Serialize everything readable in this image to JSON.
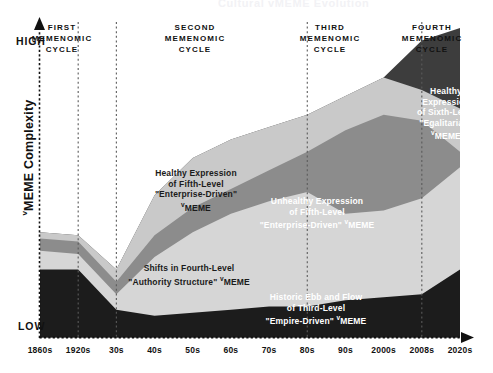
{
  "page": {
    "cut_off_title": "Cultural ᴠMEME Evolution",
    "background_color": "#ffffff"
  },
  "axes": {
    "y_title": "ᴠMEME Complexity",
    "y_title_prefix": "ᴠ",
    "y_title_rest": "MEME Complexity",
    "y_high_label": "HIGH",
    "y_low_label": "LOW",
    "x_tick_labels": [
      "1860s",
      "1920s",
      "30s",
      "40s",
      "50s",
      "60s",
      "70s",
      "80s",
      "90s",
      "2000s",
      "2008s",
      "2020s"
    ],
    "axis_color": "#111111",
    "axis_style": "dotted-arrow"
  },
  "cycles": [
    {
      "id": "first",
      "label_lines": [
        "FIRST",
        "MEMENOMIC",
        "CYCLE"
      ]
    },
    {
      "id": "second",
      "label_lines": [
        "SECOND",
        "MEMENOMIC",
        "CYCLE"
      ]
    },
    {
      "id": "third",
      "label_lines": [
        "THIRD",
        "MEMENOMIC",
        "CYCLE"
      ]
    },
    {
      "id": "fourth",
      "label_lines": [
        "FOURTH",
        "MEMENOMIC",
        "CYCLE"
      ]
    }
  ],
  "area_labels": [
    {
      "id": "healthy-fifth",
      "lines": [
        "Healthy Expression",
        "of Fifth-Level",
        "\"Enterprise-Driven\"",
        "ᴠMEME"
      ],
      "tone": "dark"
    },
    {
      "id": "unhealthy-fifth",
      "lines": [
        "Unhealthy Expression",
        "of Fifth-Level",
        "\"Enterprise-Driven\" ᴠMEME"
      ],
      "tone": "light"
    },
    {
      "id": "shifts-fourth",
      "lines": [
        "Shifts in Fourth-Level",
        "\"Authority Structure\" ᴠMEME"
      ],
      "tone": "dark"
    },
    {
      "id": "historic-third",
      "lines": [
        "Historic Ebb and Flow",
        "of Third-Level",
        "\"Empire-Driven\" ᴠMEME"
      ],
      "tone": "light"
    },
    {
      "id": "healthy-sixth",
      "lines": [
        "Healthy",
        "Expression",
        "of  Sixth-Level",
        "\"Egalitarian\"",
        "ᴠMEME"
      ],
      "tone": "light"
    }
  ],
  "chart_data": {
    "type": "area",
    "xlabel": "",
    "ylabel": "ᴠMEME Complexity",
    "ylim": [
      0,
      100
    ],
    "ylim_labels": [
      "LOW",
      "HIGH"
    ],
    "grid": false,
    "legend_position": "inline-annotations",
    "x": [
      "1860s",
      "1920s",
      "30s",
      "40s",
      "50s",
      "60s",
      "70s",
      "80s",
      "90s",
      "2000s",
      "2008s",
      "2020s"
    ],
    "cycle_boundaries": [
      "1920s",
      "30s",
      "80s",
      "2008s"
    ],
    "series": [
      {
        "name": "Historic Ebb and Flow of Third-Level \"Empire-Driven\" ᴠMEME",
        "color": "#1c1c1c",
        "stacked_top_values": [
          22,
          22,
          9,
          7,
          8,
          9,
          10,
          10,
          12,
          13,
          14,
          22
        ]
      },
      {
        "name": "Shifts in Fourth-Level \"Authority Structure\" ᴠMEME",
        "color": "#d6d6d6",
        "stacked_top_values": [
          28,
          27,
          14,
          26,
          34,
          40,
          44,
          47,
          40,
          41,
          45,
          55
        ]
      },
      {
        "name": "Unhealthy Expression of Fifth-Level \"Enterprise-Driven\" ᴠMEME",
        "color": "#8c8c8c",
        "stacked_top_values": [
          32,
          31,
          18,
          33,
          42,
          48,
          54,
          60,
          67,
          72,
          70,
          60
        ]
      },
      {
        "name": "Healthy Expression of Fifth-Level \"Enterprise-Driven\" ᴠMEME",
        "color": "#c9c9c9",
        "stacked_top_values": [
          34,
          33,
          22,
          46,
          58,
          64,
          68,
          72,
          78,
          84,
          80,
          74
        ]
      },
      {
        "name": "Healthy Expression of Sixth-Level \"Egalitarian\" ᴠMEME",
        "color": "#3d3d3d",
        "stacked_top_values": [
          34,
          33,
          22,
          46,
          58,
          64,
          68,
          72,
          78,
          84,
          96,
          100
        ]
      }
    ]
  },
  "colors": {
    "layer_third": "#1c1c1c",
    "layer_fourth": "#d6d6d6",
    "layer_fifth_unhealthy": "#8c8c8c",
    "layer_fifth_healthy": "#c9c9c9",
    "layer_sixth": "#3d3d3d",
    "background": "#ffffff",
    "axis": "#111111",
    "text_dark": "#1b1b1b",
    "text_light": "#ffffff"
  }
}
